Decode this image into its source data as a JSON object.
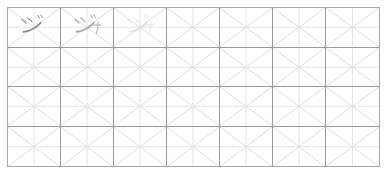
{
  "worksheet": {
    "title": "Katakana handwriting practice grid",
    "description": "Japanese kana practice sheet with diagonal and cross guide lines",
    "frame": {
      "x": 7,
      "y": 7,
      "width": 373,
      "height": 160,
      "border_color": "#a8a8a8",
      "background_color": "#ffffff"
    },
    "grid": {
      "columns": 7,
      "rows": 4,
      "cell_width": 53.3,
      "cell_height": 40,
      "major_line_color": "#9a9a9a",
      "minor_line_color": "#d8d8d8",
      "diagonal_line_color": "#dedede",
      "cross_line_color": "#e4e4e4"
    },
    "cells": [
      {
        "row": 1,
        "column": 1,
        "character": "ジ",
        "reading": "ji",
        "script": "katakana",
        "mode": "written",
        "ink_color": "#8e8e8e",
        "opacity": 1.0,
        "has_yoon": false
      },
      {
        "row": 1,
        "column": 2,
        "character": "ジャ",
        "reading": "ja",
        "script": "katakana",
        "mode": "written",
        "ink_color": "#9c9c9c",
        "opacity": 0.85,
        "has_yoon": true
      },
      {
        "row": 1,
        "column": 3,
        "character": "ジャ",
        "reading": "ja",
        "script": "katakana",
        "mode": "trace-guide",
        "ink_color": "#c9c9c9",
        "opacity": 0.45,
        "has_yoon": true
      },
      {
        "row": 1,
        "column": 4,
        "character": "",
        "reading": "",
        "script": "",
        "mode": "empty",
        "ink_color": "",
        "opacity": 0,
        "has_yoon": false
      },
      {
        "row": 1,
        "column": 5,
        "character": "",
        "reading": "",
        "script": "",
        "mode": "empty",
        "ink_color": "",
        "opacity": 0,
        "has_yoon": false
      },
      {
        "row": 1,
        "column": 6,
        "character": "",
        "reading": "",
        "script": "",
        "mode": "empty",
        "ink_color": "",
        "opacity": 0,
        "has_yoon": false
      },
      {
        "row": 1,
        "column": 7,
        "character": "",
        "reading": "",
        "script": "",
        "mode": "empty",
        "ink_color": "",
        "opacity": 0,
        "has_yoon": false
      },
      {
        "row": 2,
        "column": 1,
        "character": "",
        "reading": "",
        "script": "",
        "mode": "empty",
        "ink_color": "",
        "opacity": 0,
        "has_yoon": false
      },
      {
        "row": 2,
        "column": 2,
        "character": "",
        "reading": "",
        "script": "",
        "mode": "empty",
        "ink_color": "",
        "opacity": 0,
        "has_yoon": false
      },
      {
        "row": 2,
        "column": 3,
        "character": "",
        "reading": "",
        "script": "",
        "mode": "empty",
        "ink_color": "",
        "opacity": 0,
        "has_yoon": false
      },
      {
        "row": 2,
        "column": 4,
        "character": "",
        "reading": "",
        "script": "",
        "mode": "empty",
        "ink_color": "",
        "opacity": 0,
        "has_yoon": false
      },
      {
        "row": 2,
        "column": 5,
        "character": "",
        "reading": "",
        "script": "",
        "mode": "empty",
        "ink_color": "",
        "opacity": 0,
        "has_yoon": false
      },
      {
        "row": 2,
        "column": 6,
        "character": "",
        "reading": "",
        "script": "",
        "mode": "empty",
        "ink_color": "",
        "opacity": 0,
        "has_yoon": false
      },
      {
        "row": 2,
        "column": 7,
        "character": "",
        "reading": "",
        "script": "",
        "mode": "empty",
        "ink_color": "",
        "opacity": 0,
        "has_yoon": false
      },
      {
        "row": 3,
        "column": 1,
        "character": "",
        "reading": "",
        "script": "",
        "mode": "empty",
        "ink_color": "",
        "opacity": 0,
        "has_yoon": false
      },
      {
        "row": 3,
        "column": 2,
        "character": "",
        "reading": "",
        "script": "",
        "mode": "empty",
        "ink_color": "",
        "opacity": 0,
        "has_yoon": false
      },
      {
        "row": 3,
        "column": 3,
        "character": "",
        "reading": "",
        "script": "",
        "mode": "empty",
        "ink_color": "",
        "opacity": 0,
        "has_yoon": false
      },
      {
        "row": 3,
        "column": 4,
        "character": "",
        "reading": "",
        "script": "",
        "mode": "empty",
        "ink_color": "",
        "opacity": 0,
        "has_yoon": false
      },
      {
        "row": 3,
        "column": 5,
        "character": "",
        "reading": "",
        "script": "",
        "mode": "empty",
        "ink_color": "",
        "opacity": 0,
        "has_yoon": false
      },
      {
        "row": 3,
        "column": 6,
        "character": "",
        "reading": "",
        "script": "",
        "mode": "empty",
        "ink_color": "",
        "opacity": 0,
        "has_yoon": false
      },
      {
        "row": 3,
        "column": 7,
        "character": "",
        "reading": "",
        "script": "",
        "mode": "empty",
        "ink_color": "",
        "opacity": 0,
        "has_yoon": false
      },
      {
        "row": 4,
        "column": 1,
        "character": "",
        "reading": "",
        "script": "",
        "mode": "empty",
        "ink_color": "",
        "opacity": 0,
        "has_yoon": false
      },
      {
        "row": 4,
        "column": 2,
        "character": "",
        "reading": "",
        "script": "",
        "mode": "empty",
        "ink_color": "",
        "opacity": 0,
        "has_yoon": false
      },
      {
        "row": 4,
        "column": 3,
        "character": "",
        "reading": "",
        "script": "",
        "mode": "empty",
        "ink_color": "",
        "opacity": 0,
        "has_yoon": false
      },
      {
        "row": 4,
        "column": 4,
        "character": "",
        "reading": "",
        "script": "",
        "mode": "empty",
        "ink_color": "",
        "opacity": 0,
        "has_yoon": false
      },
      {
        "row": 4,
        "column": 5,
        "character": "",
        "reading": "",
        "script": "",
        "mode": "empty",
        "ink_color": "",
        "opacity": 0,
        "has_yoon": false
      },
      {
        "row": 4,
        "column": 6,
        "character": "",
        "reading": "",
        "script": "",
        "mode": "empty",
        "ink_color": "",
        "opacity": 0,
        "has_yoon": false
      },
      {
        "row": 4,
        "column": 7,
        "character": "",
        "reading": "",
        "script": "",
        "mode": "empty",
        "ink_color": "",
        "opacity": 0,
        "has_yoon": false
      }
    ]
  }
}
